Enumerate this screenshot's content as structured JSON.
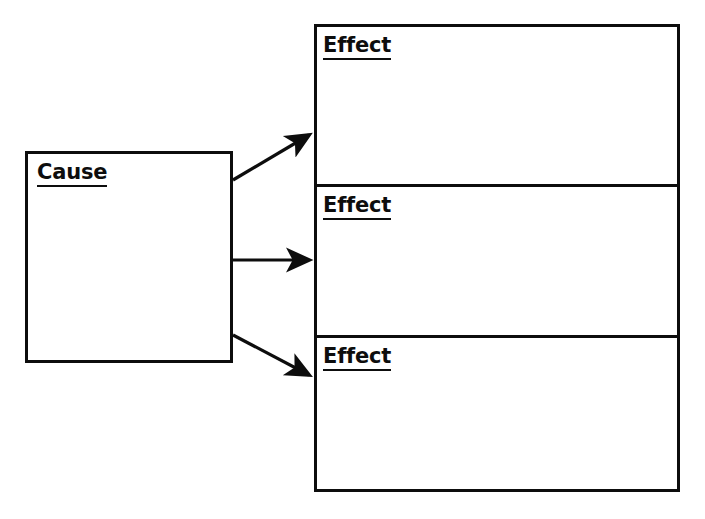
{
  "document": {
    "type": "graphic-organizer",
    "title": "Cause and Effect Graphic Organizer",
    "background_color": "#ffffff",
    "line_color": "#0d0d0d",
    "text_color": "#0d0d0d"
  },
  "cause": {
    "label": "Cause",
    "body_text": ""
  },
  "effects": [
    {
      "label": "Effect",
      "body_text": ""
    },
    {
      "label": "Effect",
      "body_text": ""
    },
    {
      "label": "Effect",
      "body_text": ""
    }
  ],
  "connectors": [
    {
      "name": "cause-to-effect-1",
      "from": "cause",
      "to": "effect-1",
      "direction": "up-right"
    },
    {
      "name": "cause-to-effect-2",
      "from": "cause",
      "to": "effect-2",
      "direction": "right"
    },
    {
      "name": "cause-to-effect-3",
      "from": "cause",
      "to": "effect-3",
      "direction": "down-right"
    }
  ]
}
